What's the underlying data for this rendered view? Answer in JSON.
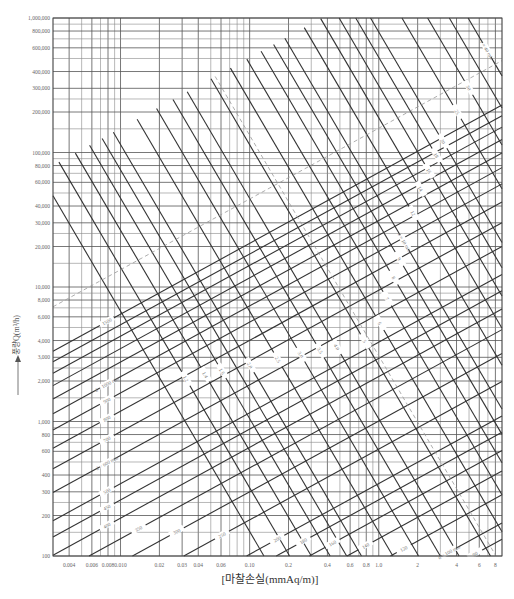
{
  "chart_data": {
    "type": "line",
    "title": "",
    "xlabel": "[마찰손실(mmAq/m)]",
    "ylabel": "풍량Q(m³/h)",
    "x_scale": "log",
    "y_scale": "log",
    "xlim": [
      0.003,
      9
    ],
    "ylim": [
      100,
      1000000
    ],
    "grid": true,
    "x_ticks": [
      {
        "value": 0.004,
        "label": "0.004"
      },
      {
        "value": 0.006,
        "label": "0.006"
      },
      {
        "value": 0.008,
        "label": "0.008"
      },
      {
        "value": 0.01,
        "label": "0.010"
      },
      {
        "value": 0.02,
        "label": "0.02"
      },
      {
        "value": 0.03,
        "label": "0.03"
      },
      {
        "value": 0.04,
        "label": "0.04"
      },
      {
        "value": 0.06,
        "label": "0.06"
      },
      {
        "value": 0.1,
        "label": "0.10"
      },
      {
        "value": 0.2,
        "label": "0.2"
      },
      {
        "value": 0.4,
        "label": "0.4"
      },
      {
        "value": 0.6,
        "label": "0.6"
      },
      {
        "value": 0.8,
        "label": "0.8"
      },
      {
        "value": 1.0,
        "label": "1.0"
      },
      {
        "value": 2,
        "label": "2"
      },
      {
        "value": 4,
        "label": "4"
      },
      {
        "value": 6,
        "label": "6"
      },
      {
        "value": 8,
        "label": "8"
      }
    ],
    "x_minor_grid": [
      0.003,
      0.004,
      0.005,
      0.006,
      0.007,
      0.008,
      0.009,
      0.01,
      0.02,
      0.03,
      0.04,
      0.05,
      0.06,
      0.07,
      0.08,
      0.09,
      0.1,
      0.2,
      0.3,
      0.4,
      0.5,
      0.6,
      0.7,
      0.8,
      0.9,
      1,
      2,
      3,
      4,
      5,
      6,
      7,
      8,
      9
    ],
    "y_ticks": [
      {
        "value": 100,
        "label": "100"
      },
      {
        "value": 200,
        "label": "200"
      },
      {
        "value": 300,
        "label": "300"
      },
      {
        "value": 400,
        "label": "400"
      },
      {
        "value": 600,
        "label": "600"
      },
      {
        "value": 800,
        "label": "800"
      },
      {
        "value": 1000,
        "label": "1,000"
      },
      {
        "value": 2000,
        "label": "2,000"
      },
      {
        "value": 3000,
        "label": "3,000"
      },
      {
        "value": 4000,
        "label": "4,000"
      },
      {
        "value": 6000,
        "label": "6,000"
      },
      {
        "value": 8000,
        "label": "8,000"
      },
      {
        "value": 10000,
        "label": "10,000"
      },
      {
        "value": 20000,
        "label": "20,000"
      },
      {
        "value": 30000,
        "label": "30,000"
      },
      {
        "value": 40000,
        "label": "40,000"
      },
      {
        "value": 60000,
        "label": "60,000"
      },
      {
        "value": 80000,
        "label": "80,000"
      },
      {
        "value": 100000,
        "label": "100,000"
      },
      {
        "value": 200000,
        "label": "200,000"
      },
      {
        "value": 300000,
        "label": "300,000"
      },
      {
        "value": 400000,
        "label": "400,000"
      },
      {
        "value": 600000,
        "label": "600,000"
      },
      {
        "value": 800000,
        "label": "800,000"
      },
      {
        "value": 1000000,
        "label": "1,000,000"
      }
    ],
    "y_minor_grid": [
      100,
      150,
      200,
      250,
      300,
      400,
      500,
      600,
      700,
      800,
      900,
      1000,
      1500,
      2000,
      2500,
      3000,
      4000,
      5000,
      6000,
      7000,
      8000,
      9000,
      10000,
      15000,
      20000,
      25000,
      30000,
      40000,
      50000,
      60000,
      70000,
      80000,
      90000,
      100000,
      150000,
      200000,
      250000,
      300000,
      400000,
      500000,
      600000,
      700000,
      800000,
      900000,
      1000000
    ],
    "diameter_lines": {
      "unit": "mm",
      "label_prefix": "d = ",
      "values": [
        1500,
        1400,
        1300,
        1200,
        1100,
        1000,
        900,
        800,
        700,
        600,
        500,
        450,
        400,
        350,
        300,
        250,
        200,
        180,
        160,
        140,
        120,
        100,
        90,
        80,
        70,
        60,
        50
      ],
      "labeled": {
        "1500": "1500",
        "1000": "d = 1000 mm",
        "900": "900",
        "800": "800",
        "700": "700",
        "600": "d = 600 mm",
        "500": "500",
        "450": "450",
        "400": "400",
        "350": "350",
        "300": "300",
        "250": "250",
        "200": "200",
        "180": "180",
        "160": "160",
        "140": "140",
        "120": "120",
        "100": "d = 100 mm",
        "90": "90",
        "80": "80",
        "70": "70",
        "60": "60"
      }
    },
    "velocity_lines": {
      "unit": "m/s",
      "label_prefix": "v = ",
      "values": [
        40,
        35,
        30,
        25,
        20,
        18,
        16,
        14,
        12,
        10,
        9,
        8,
        7,
        6,
        5,
        4,
        3.5,
        3,
        2.5,
        2,
        1.8,
        1.6,
        1.4,
        1.2,
        1.0
      ],
      "labeled": {
        "40": "v = 40 m/s",
        "30": "30",
        "25": "25",
        "20": "20",
        "18": "18",
        "16": "16",
        "14": "14",
        "12": "12",
        "10": "v = 10 m/s",
        "9": "9",
        "8": "8",
        "7": "7",
        "6": "6",
        "5": "5",
        "4": "4.0",
        "3.5": "3.5",
        "3": "3.0",
        "2.5": "2.5",
        "2": "2.0",
        "1.6": "1.6",
        "1.4": "1.4",
        "1.2": "1.2",
        "1.0": "1.0"
      }
    },
    "dashed_lines": [
      {
        "label": "v = 5 m/s",
        "velocity": 5
      },
      {
        "label": "d = 2000 mm",
        "diameter": 2000
      }
    ]
  },
  "axis_arrow": "up-arrow"
}
